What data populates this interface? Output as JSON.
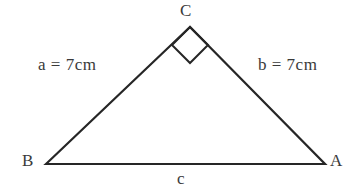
{
  "figure": {
    "type": "right-triangle-diagram",
    "background_color": "#ffffff",
    "stroke_color": "#262626",
    "text_color": "#3a3a3a",
    "stroke_width": 2.2,
    "vertices": {
      "C": {
        "x": 190,
        "y": 27
      },
      "B": {
        "x": 46,
        "y": 164
      },
      "A": {
        "x": 325,
        "y": 164
      }
    },
    "right_angle_marker": {
      "at_vertex": "C",
      "shape": "diamond",
      "size": 20
    }
  },
  "labels": {
    "vertex_c": "C",
    "vertex_b": "B",
    "vertex_a": "A",
    "side_a": "a  =  7cm",
    "side_b": "b  =  7cm",
    "side_c": "c"
  }
}
